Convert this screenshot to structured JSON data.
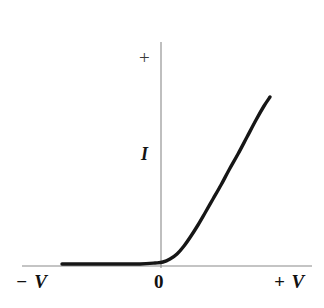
{
  "figure": {
    "background_color": "#ffffff",
    "width": 324,
    "height": 308
  },
  "labels": {
    "plus_top": "+",
    "current_axis": "I",
    "origin": "0",
    "negative_voltage": "− V",
    "positive_voltage": "+ V"
  },
  "chart_data": {
    "type": "line",
    "title": "",
    "subtitle": "",
    "xlabel": "V",
    "ylabel": "I",
    "annotations": [
      {
        "name": "plus-top",
        "text": "+",
        "x_px": 147,
        "y_px": 59
      },
      {
        "name": "current-axis",
        "text": "I",
        "x_px": 146,
        "y_px": 155
      },
      {
        "name": "origin",
        "text": "0",
        "x_px": 162,
        "y_px": 283
      },
      {
        "name": "negative-voltage",
        "text": "− V",
        "x_px": 33,
        "y_px": 283
      },
      {
        "name": "positive-voltage",
        "text": "+ V",
        "x_px": 294,
        "y_px": 283
      }
    ],
    "grid": false,
    "legend": null,
    "axes": {
      "x_axis": {
        "name": "voltage-axis",
        "orientation": "horizontal",
        "x_start_px": 22,
        "x_end_px": 312,
        "y_px": 266,
        "stroke": "#8a8a8a",
        "stroke_width": 1.1,
        "tick_labels": [
          "− V",
          "0",
          "+ V"
        ]
      },
      "y_axis": {
        "name": "current-axis",
        "orientation": "vertical",
        "x_px": 161,
        "y_start_px": 42,
        "y_end_px": 268,
        "stroke": "#8a8a8a",
        "stroke_width": 1.1,
        "tick_labels": [
          "+"
        ]
      }
    },
    "series": [
      {
        "name": "diode-iv-curve",
        "color": "#161616",
        "stroke_width": 3.4,
        "description": "Diode current-voltage characteristic: near-zero reverse current for V<0, exponential turn-on knee at origin, steeply rising forward current.",
        "points_px": [
          [
            62,
            264
          ],
          [
            90,
            264
          ],
          [
            118,
            264
          ],
          [
            140,
            264
          ],
          [
            155,
            263
          ],
          [
            163,
            262
          ],
          [
            170,
            259
          ],
          [
            177,
            254
          ],
          [
            184,
            246
          ],
          [
            191,
            236
          ],
          [
            198,
            225
          ],
          [
            205,
            213
          ],
          [
            213,
            199
          ],
          [
            221,
            185
          ],
          [
            229,
            170
          ],
          [
            238,
            154
          ],
          [
            247,
            137
          ],
          [
            256,
            120
          ],
          [
            264,
            106
          ],
          [
            270,
            97
          ]
        ]
      }
    ]
  }
}
